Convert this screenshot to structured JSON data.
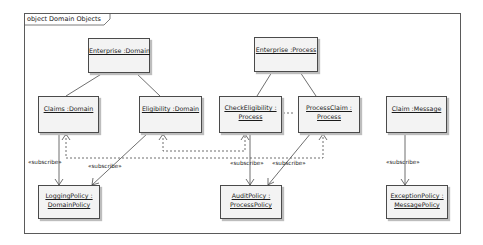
{
  "diagram": {
    "frame_title": "object Domain Objects",
    "nodes": [
      {
        "id": "enterprise-domain",
        "lines": [
          "Enterprise :Domain"
        ]
      },
      {
        "id": "enterprise-process",
        "lines": [
          "Enterprise :Process"
        ]
      },
      {
        "id": "claims-domain",
        "lines": [
          "Claims :Domain"
        ]
      },
      {
        "id": "eligibility-domain",
        "lines": [
          "Eligibility :Domain"
        ]
      },
      {
        "id": "check-eligibility-process",
        "lines": [
          "CheckEligibility :",
          "Process"
        ]
      },
      {
        "id": "process-claim-process",
        "lines": [
          "ProcessClaim :",
          "Process"
        ]
      },
      {
        "id": "claim-message",
        "lines": [
          "Claim :Message"
        ]
      },
      {
        "id": "logging-policy",
        "lines": [
          "LoggingPolicy :",
          "DomainPolicy"
        ]
      },
      {
        "id": "audit-policy",
        "lines": [
          "AuditPolicy :",
          "ProcessPolicy"
        ]
      },
      {
        "id": "exception-policy",
        "lines": [
          "ExceptionPolicy :",
          "MessagePolicy"
        ]
      }
    ],
    "edge_labels": {
      "subscribe_1": "«subscribe»",
      "subscribe_2": "«subscribe»",
      "subscribe_3": "«subscribe»",
      "subscribe_4": "«subscribe»",
      "subscribe_5": "«subscribe»"
    },
    "colors": {
      "node_fill": "#f3f3f3",
      "node_border": "#4a4a4a",
      "line": "#4a4a4a",
      "shadow": "#bdbdbd"
    }
  }
}
